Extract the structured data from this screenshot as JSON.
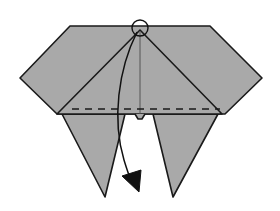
{
  "diagram": {
    "type": "origami-step",
    "colors": {
      "paper": "#a9a9a9",
      "line": "#1a1a1a",
      "background": "#ffffff"
    },
    "elements": {
      "hexagon_body": "hexagonal folded paper body",
      "center_triangle": "triangular flap with apex at top center",
      "center_crease": "vertical center crease",
      "valley_fold_line": "dashed horizontal valley fold line",
      "left_point": "left downward-pointing flap",
      "right_point": "right downward-pointing flap",
      "apex_marker": "circle highlighting the apex point",
      "fold_arrow": "curved arrow showing apex folding down"
    }
  }
}
